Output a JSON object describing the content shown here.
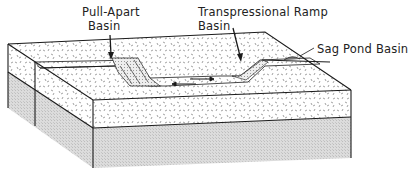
{
  "diagram": {
    "type": "block-diagram",
    "labels": {
      "pull_apart": {
        "line1": "Pull-Apart",
        "line2": "Basin"
      },
      "transpressional": {
        "line1": "Transpressional Ramp",
        "line2": "Basin"
      },
      "sag_pond": "Sag Pond Basin"
    },
    "colors": {
      "line": "#1a1a1a",
      "speckle_fill": "#ffffff",
      "speckle_mark": "#777777",
      "stipple_fill": "#d9d9d9",
      "basin_fill": "#e6e6e6"
    }
  }
}
